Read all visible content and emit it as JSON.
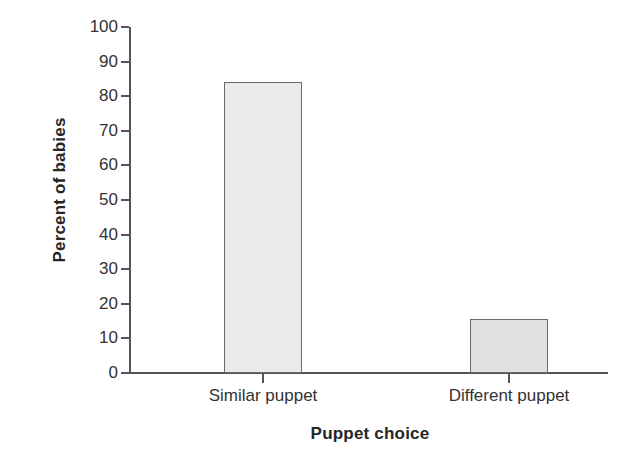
{
  "chart_data": {
    "type": "bar",
    "title": "",
    "subtitle": "",
    "categories": [
      "Similar puppet",
      "Different puppet"
    ],
    "values": [
      84,
      15.5
    ],
    "xlabel": "Puppet choice",
    "ylabel": "Percent of babies",
    "ylim": [
      0,
      100
    ],
    "ytick_labels": [
      "100",
      "90",
      "80",
      "70",
      "60",
      "50",
      "40",
      "30",
      "20",
      "10",
      "0"
    ],
    "ytick_values": [
      100,
      90,
      80,
      70,
      60,
      50,
      40,
      30,
      20,
      10,
      0
    ],
    "grid": false,
    "legend": "none",
    "bar_colors": [
      "#ebebeb",
      "#e0e0e0"
    ],
    "bar_border_color": "#6a6a6a",
    "axis_color": "#545454",
    "background": "#ffffff",
    "annotations": []
  },
  "axes": {
    "y_title": "Percent of babies",
    "x_title": "Puppet choice"
  },
  "bars": [
    {
      "label": "Similar puppet",
      "value": 84,
      "fill": "#ebebeb"
    },
    {
      "label": "Different puppet",
      "value": 15.5,
      "fill": "#e0e0e0"
    }
  ]
}
